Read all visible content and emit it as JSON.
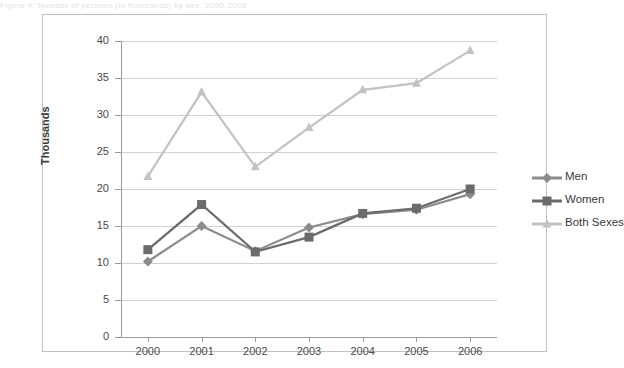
{
  "top_strip_text": "Figure 4: Number of persons (in thousands) by sex, 2000-2006",
  "chart_data": {
    "type": "line",
    "title": "",
    "xlabel": "",
    "ylabel": "Thousands",
    "categories": [
      "2000",
      "2001",
      "2002",
      "2003",
      "2004",
      "2005",
      "2006"
    ],
    "ylim": [
      0,
      40
    ],
    "ytick_step": 5,
    "yticks": [
      "0",
      "5",
      "10",
      "15",
      "20",
      "25",
      "30",
      "35",
      "40"
    ],
    "grid": "horizontal",
    "legend_position": "right",
    "series": [
      {
        "name": "Men",
        "color": "#8b8b8b",
        "marker": "diamond",
        "values": [
          10.2,
          15.0,
          11.6,
          14.8,
          16.6,
          17.2,
          19.3
        ]
      },
      {
        "name": "Women",
        "color": "#6b6b6b",
        "marker": "square",
        "values": [
          11.8,
          17.9,
          11.5,
          13.5,
          16.7,
          17.4,
          20.0
        ]
      },
      {
        "name": "Both Sexes",
        "color": "#c2c2c2",
        "marker": "triangle",
        "values": [
          21.7,
          33.1,
          23.0,
          28.3,
          33.4,
          34.3,
          38.7
        ]
      }
    ]
  },
  "colors": {
    "men": "#8b8b8b",
    "women": "#6b6b6b",
    "both": "#c2c2c2",
    "grid": "#d2d2d2",
    "axis": "#9a9a9a",
    "border": "#c0c0c0"
  }
}
